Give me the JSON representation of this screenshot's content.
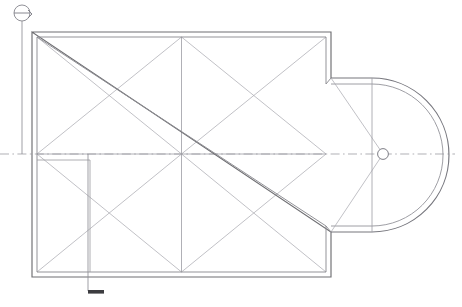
{
  "drawing": {
    "type": "architectural-floor-plan",
    "subject": "Basilica roof / vault plan with semicircular apse",
    "canvas": {
      "width": 462,
      "height": 307
    },
    "background_color": "#ffffff",
    "line_color_primary": "#6e6e72",
    "line_color_secondary": "#9a9aa0",
    "line_color_light": "#a9a9b0",
    "accent_color": "#3c3c40"
  },
  "nave": {
    "label": "nave-rectangle",
    "outer": {
      "x": 32,
      "y": 32,
      "width": 299,
      "height": 245
    },
    "inner": {
      "x": 37,
      "y": 37,
      "width": 289,
      "height": 235
    },
    "bay_count": 4,
    "bay_grid": {
      "columns": 2,
      "rows": 2
    },
    "mid_x": 181.5,
    "mid_y": 154.5
  },
  "apse": {
    "label": "semicircular-apse",
    "opening_x": 331,
    "top_y": 78,
    "bottom_y": 228,
    "outer_radius": 77,
    "inner_radius": 71,
    "center": {
      "x": 372,
      "y": 154
    },
    "outer_tip_x": 449,
    "inner_tip_x": 443
  },
  "apse_pier": {
    "label": "central-pier",
    "center": {
      "x": 383,
      "y": 154
    },
    "radius": 5.4
  },
  "partition": {
    "label": "interior-partition-wall",
    "start": {
      "x": 37,
      "y": 160
    },
    "corner": {
      "x": 90,
      "y": 160
    },
    "end": {
      "x": 90,
      "y": 272
    }
  },
  "centerline": {
    "label": "horizontal-axis-centerline",
    "y": 154,
    "x_start": 0,
    "x_end": 455,
    "dash_pattern": "9 3.4 1.6 3.4"
  },
  "section_marker": {
    "label": "section-cut-marker",
    "circle": {
      "cx": 22,
      "cy": 13,
      "r": 8
    },
    "bar_y": 13,
    "arrow_tip": {
      "x": 32,
      "y": 17
    },
    "line_x": 22,
    "line_top_y": 21,
    "line_bottom_y": 295,
    "tick": {
      "x": 88,
      "y": 291,
      "width": 16,
      "height": 3.5
    }
  },
  "annotations": {
    "has_title_text": false,
    "has_dimension_text": false,
    "visible_text": ""
  }
}
